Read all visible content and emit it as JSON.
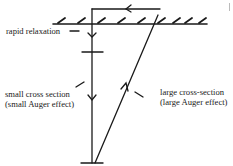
{
  "diagram": {
    "colors": {
      "line": "#1a1a1a",
      "background": "#ffffff"
    },
    "labels": {
      "rapid_relaxation": "rapid relaxation",
      "small_cross_section": [
        "small cross section",
        "(small Auger effect)"
      ],
      "large_cross_section": [
        "large cross-section",
        "(large Auger effect)"
      ]
    },
    "elements": [
      {
        "name": "surface-line",
        "type": "hatched-surface"
      },
      {
        "name": "vertical-transition",
        "type": "line",
        "arrows": [
          "down",
          "down"
        ]
      },
      {
        "name": "top-connector",
        "type": "line",
        "arrows": [
          "left"
        ]
      },
      {
        "name": "diagonal-transition",
        "type": "line",
        "arrows": [
          "up"
        ]
      },
      {
        "name": "energy-level-middle",
        "type": "tick"
      },
      {
        "name": "energy-level-bottom",
        "type": "tick"
      }
    ]
  }
}
